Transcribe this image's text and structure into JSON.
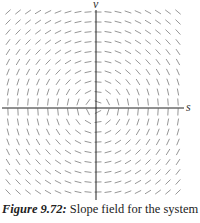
{
  "figure": {
    "caption_label": "Figure 9.72:",
    "caption_text": " Slope field for the system",
    "axes": {
      "horizontal_label": "s",
      "vertical_label": "v"
    },
    "field": {
      "description": "Slope field forming concentric closed curves around the origin (dv/ds = -s/v)",
      "columns": 18,
      "rows": 19,
      "x_start": 8,
      "y_start": 12,
      "spacing_x": 10,
      "spacing_y": 10,
      "origin_px": [
        96,
        108
      ],
      "segment_length": 7,
      "stroke_color": "#8a8a8a",
      "axis_color": "#222222"
    }
  }
}
